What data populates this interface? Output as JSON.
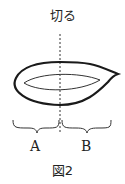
{
  "figure": {
    "cut_label": "切る",
    "label_a": "A",
    "label_b": "B",
    "caption": "図2"
  },
  "colors": {
    "stroke": "#1a1a1a",
    "background": "#ffffff"
  }
}
